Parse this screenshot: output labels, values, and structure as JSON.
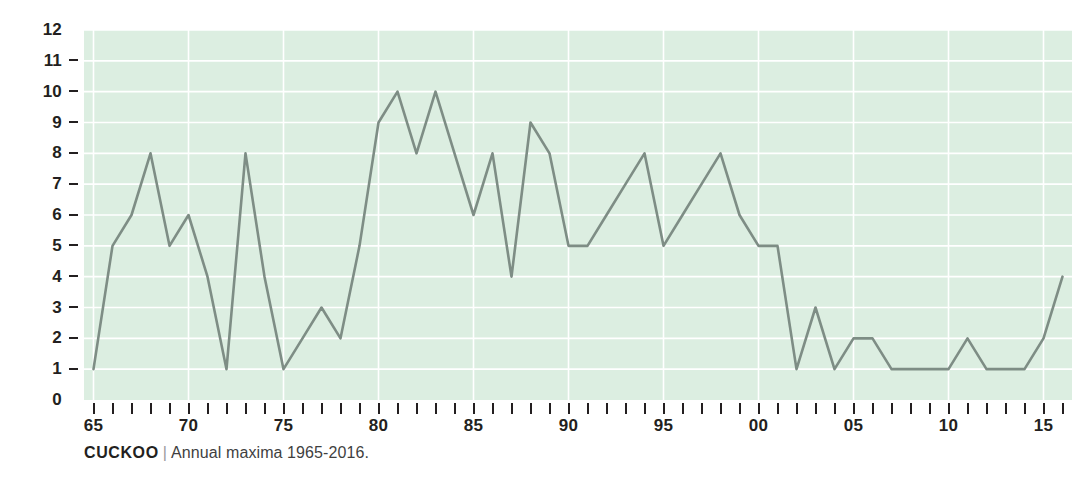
{
  "chart_data": {
    "type": "line",
    "title": "",
    "subtitle": "",
    "xlabel": "",
    "ylabel": "",
    "grid": true,
    "legend": "none",
    "line_color": "#7e8d85",
    "plot_background": "#dceee1",
    "gridline_color": "#ffffff",
    "xlim": [
      1964.5,
      2016.5
    ],
    "ylim": [
      0,
      12
    ],
    "x": [
      1965,
      1966,
      1967,
      1968,
      1969,
      1970,
      1971,
      1972,
      1973,
      1974,
      1975,
      1976,
      1977,
      1978,
      1979,
      1980,
      1981,
      1982,
      1983,
      1984,
      1985,
      1986,
      1987,
      1988,
      1989,
      1990,
      1991,
      1992,
      1993,
      1994,
      1995,
      1996,
      1997,
      1998,
      1999,
      2000,
      2001,
      2002,
      2003,
      2004,
      2005,
      2006,
      2007,
      2008,
      2009,
      2010,
      2011,
      2012,
      2013,
      2014,
      2015,
      2016
    ],
    "values": [
      1,
      5,
      6,
      8,
      5,
      6,
      4,
      1,
      8,
      4,
      1,
      2,
      3,
      2,
      5,
      9,
      10,
      8,
      10,
      8,
      6,
      8,
      4,
      9,
      8,
      5,
      5,
      6,
      7,
      8,
      5,
      6,
      7,
      8,
      6,
      5,
      5,
      1,
      3,
      1,
      2,
      2,
      1,
      1,
      1,
      1,
      2,
      1,
      1,
      1,
      2,
      4
    ],
    "y_ticks": [
      {
        "value": 12,
        "label": "12",
        "dash": false
      },
      {
        "value": 11,
        "label": "11",
        "dash": true
      },
      {
        "value": 10,
        "label": "10",
        "dash": true
      },
      {
        "value": 9,
        "label": "9",
        "dash": true
      },
      {
        "value": 8,
        "label": "8",
        "dash": true
      },
      {
        "value": 7,
        "label": "7",
        "dash": true
      },
      {
        "value": 6,
        "label": "6",
        "dash": true
      },
      {
        "value": 5,
        "label": "5",
        "dash": true
      },
      {
        "value": 4,
        "label": "4",
        "dash": true
      },
      {
        "value": 3,
        "label": "3",
        "dash": true
      },
      {
        "value": 2,
        "label": "2",
        "dash": true
      },
      {
        "value": 1,
        "label": "1",
        "dash": true
      },
      {
        "value": 0,
        "label": "0",
        "dash": false
      }
    ],
    "x_tick_years": [
      1965,
      1966,
      1967,
      1968,
      1969,
      1970,
      1971,
      1972,
      1973,
      1974,
      1975,
      1976,
      1977,
      1978,
      1979,
      1980,
      1981,
      1982,
      1983,
      1984,
      1985,
      1986,
      1987,
      1988,
      1989,
      1990,
      1991,
      1992,
      1993,
      1994,
      1995,
      1996,
      1997,
      1998,
      1999,
      2000,
      2001,
      2002,
      2003,
      2004,
      2005,
      2006,
      2007,
      2008,
      2009,
      2010,
      2011,
      2012,
      2013,
      2014,
      2015,
      2016
    ],
    "x_labels": [
      {
        "year": 1965,
        "label": "65"
      },
      {
        "year": 1970,
        "label": "70"
      },
      {
        "year": 1975,
        "label": "75"
      },
      {
        "year": 1980,
        "label": "80"
      },
      {
        "year": 1985,
        "label": "85"
      },
      {
        "year": 1990,
        "label": "90"
      },
      {
        "year": 1995,
        "label": "95"
      },
      {
        "year": 2000,
        "label": "00"
      },
      {
        "year": 2005,
        "label": "05"
      },
      {
        "year": 2010,
        "label": "10"
      },
      {
        "year": 2015,
        "label": "15"
      }
    ]
  },
  "caption": {
    "series_name": "CUCKOO",
    "separator": "|",
    "description": "Annual maxima 1965-2016."
  }
}
